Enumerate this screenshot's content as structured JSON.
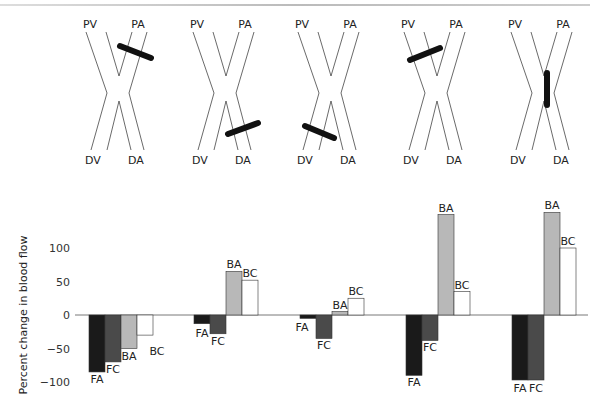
{
  "diagrams": [
    {
      "labels": {
        "pv": "PV",
        "pa": "PA",
        "dv": "DV",
        "da": "DA"
      },
      "ligature": "proximal-artery"
    },
    {
      "labels": {
        "pv": "PV",
        "pa": "PA",
        "dv": "DV",
        "da": "DA"
      },
      "ligature": "distal-artery"
    },
    {
      "labels": {
        "pv": "PV",
        "pa": "PA",
        "dv": "DV",
        "da": "DA"
      },
      "ligature": "distal-vein"
    },
    {
      "labels": {
        "pv": "PV",
        "pa": "PA",
        "dv": "DV",
        "da": "DA"
      },
      "ligature": "proximal-vein"
    },
    {
      "labels": {
        "pv": "PV",
        "pa": "PA",
        "dv": "DV",
        "da": "DA"
      },
      "ligature": "crossing"
    }
  ],
  "chart_data": {
    "type": "bar",
    "title": "",
    "xlabel": "",
    "ylabel": "Percent change in blood flow",
    "ylim": [
      -100,
      160
    ],
    "yticks": [
      100,
      50,
      0,
      -50,
      -100
    ],
    "ytick_labels": [
      "100",
      "50",
      "0",
      "−50",
      "−100"
    ],
    "grid": false,
    "legend": "none (bars labeled directly)",
    "categories": [
      "Diagram 1",
      "Diagram 2",
      "Diagram 3",
      "Diagram 4",
      "Diagram 5"
    ],
    "series": [
      {
        "name": "FA",
        "color": "#1a1a1a",
        "values": [
          -85,
          -13,
          -5,
          -90,
          -97
        ]
      },
      {
        "name": "FC",
        "color": "#4a4a4a",
        "values": [
          -70,
          -28,
          -35,
          -38,
          -97
        ]
      },
      {
        "name": "BA",
        "color": "#b8b8b8",
        "values": [
          -50,
          65,
          5,
          150,
          153
        ]
      },
      {
        "name": "BC",
        "color": "#ffffff",
        "values": [
          -30,
          52,
          25,
          35,
          100
        ]
      }
    ]
  }
}
